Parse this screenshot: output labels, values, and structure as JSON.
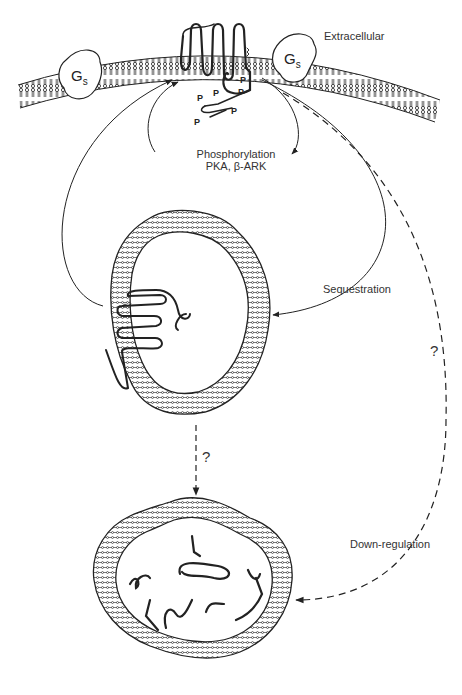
{
  "diagram": {
    "type": "receptor-regulation-schematic",
    "top_cut_text": "",
    "labels": {
      "extracellular": "Extracellular",
      "phosphorylation_line1": "Phosphorylation",
      "phosphorylation_line2": "PKA, β-ARK",
      "sequestration": "Sequestration",
      "down_regulation": "Down-regulation",
      "question_right": "?",
      "question_middle": "?"
    },
    "proteins": {
      "gs_left": {
        "main": "G",
        "sub": "s"
      },
      "gs_right": {
        "main": "G",
        "sub": "s"
      }
    },
    "phospho_sites": [
      "P",
      "P",
      "P",
      "P",
      "P",
      "P",
      "P"
    ],
    "nodes": [
      {
        "id": "plasma-membrane",
        "label": "Plasma membrane with receptor and Gs"
      },
      {
        "id": "sequestered-vesicle",
        "label": "Sequestered receptor vesicle"
      },
      {
        "id": "lysosome",
        "label": "Degraded receptor compartment"
      }
    ],
    "edges": [
      {
        "from": "plasma-membrane",
        "to": "plasma-membrane",
        "label": "Phosphorylation PKA, β-ARK",
        "style": "solid"
      },
      {
        "from": "plasma-membrane",
        "to": "sequestered-vesicle",
        "label": "Sequestration",
        "style": "solid"
      },
      {
        "from": "sequestered-vesicle",
        "to": "plasma-membrane",
        "label": "",
        "style": "solid"
      },
      {
        "from": "sequestered-vesicle",
        "to": "lysosome",
        "label": "?",
        "style": "dashed"
      },
      {
        "from": "plasma-membrane",
        "to": "lysosome",
        "label": "Down-regulation ?",
        "style": "dashed"
      }
    ],
    "colors": {
      "ink": "#222222",
      "text": "#333333",
      "background": "#ffffff"
    }
  }
}
